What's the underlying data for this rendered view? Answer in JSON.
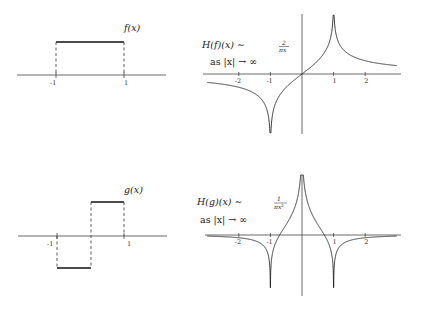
{
  "panels": {
    "f": {
      "label": "f(x)",
      "ticks": [
        {
          "x": -1,
          "label": "-1"
        },
        {
          "x": 1,
          "label": "1"
        }
      ],
      "segments": [
        {
          "from": -1,
          "to": 1,
          "value": 1
        }
      ]
    },
    "g": {
      "label": "g(x)",
      "ticks": [
        {
          "x": -1,
          "label": "-1"
        },
        {
          "x": 1,
          "label": "1"
        }
      ],
      "segments": [
        {
          "from": -1,
          "to": 0,
          "value": -1
        },
        {
          "from": 0,
          "to": 1,
          "value": 1
        }
      ]
    },
    "Hf": {
      "annotation_main": "H(f)(x) ∼ ",
      "annotation_num": "2",
      "annotation_den": "πx",
      "annotation_limit": "as |x| → ∞",
      "ticks": [
        {
          "x": -2,
          "label": "-2"
        },
        {
          "x": -1,
          "label": "-1"
        },
        {
          "x": 1,
          "label": "1"
        },
        {
          "x": 2,
          "label": "2"
        }
      ]
    },
    "Hg": {
      "annotation_main": "H(g)(x) ∼ ",
      "annotation_num": "1",
      "annotation_den": "πx²",
      "annotation_limit": "as |x| → ∞",
      "ticks": [
        {
          "x": -2,
          "label": "-2"
        },
        {
          "x": -1,
          "label": "-1"
        },
        {
          "x": 1,
          "label": "1"
        },
        {
          "x": 2,
          "label": "2"
        }
      ]
    }
  },
  "chart_data": [
    {
      "type": "line",
      "title": "f(x)",
      "description": "Indicator function of [-1,1]",
      "x": [
        -1.6,
        -1,
        -1,
        1,
        1,
        1.6
      ],
      "y": [
        0,
        0,
        1,
        1,
        0,
        0
      ],
      "xticks": [
        -1,
        1
      ]
    },
    {
      "type": "line",
      "title": "H(f)(x) ~ 2/(πx) as |x| → ∞",
      "formula": "(1/π) ln|(x+1)/(x-1)|",
      "xlim": [
        -3,
        3
      ],
      "xticks": [
        -2,
        -1,
        1,
        2
      ],
      "singularities": [
        -1,
        1
      ]
    },
    {
      "type": "line",
      "title": "g(x)",
      "description": "-1 on [-1,0], +1 on [0,1]",
      "x": [
        -1.6,
        -1,
        -1,
        0,
        0,
        1,
        1,
        1.6
      ],
      "y": [
        0,
        0,
        -1,
        -1,
        1,
        1,
        0,
        0
      ],
      "xticks": [
        -1,
        1
      ]
    },
    {
      "type": "line",
      "title": "H(g)(x) ~ 1/(πx²) as |x| → ∞",
      "formula": "(1/π) ln|(x²-1)/x²|",
      "xlim": [
        -3,
        3
      ],
      "xticks": [
        -2,
        -1,
        1,
        2
      ],
      "singularities": [
        -1,
        0,
        1
      ]
    }
  ]
}
